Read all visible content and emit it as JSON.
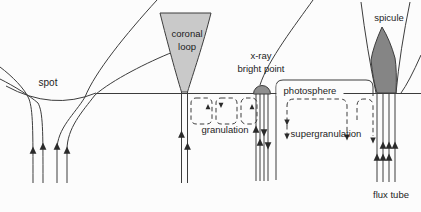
{
  "diagram": {
    "labels": {
      "spot": "spot",
      "coronal_line1": "coronal",
      "coronal_line2": "loop",
      "xray_line1": "x-ray",
      "xray_line2": "bright point",
      "photosphere": "photosphere",
      "spicule": "spicule",
      "granulation": "granulation",
      "supergranulation": "supergranulation",
      "flux_tube": "flux tube"
    },
    "colors": {
      "background": "#fcfcfc",
      "line": "#3c3c3c",
      "text": "#1c1c1c",
      "coronal_loop_fill": "#c9c9c9",
      "bright_point_fill": "#8f8f8f",
      "spicule_fill": "#858585"
    }
  }
}
